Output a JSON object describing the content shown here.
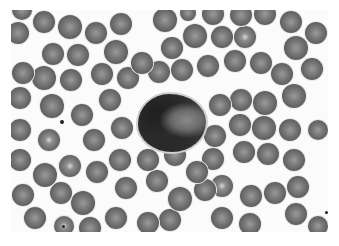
{
  "image": {
    "description": "Grayscale light micrograph of a peripheral blood smear showing a central leukocyte surrounded by erythrocytes",
    "frame": {
      "x": 11,
      "y": 10,
      "width": 317,
      "height": 222
    },
    "background": "#fbfbfb",
    "leukocyte": {
      "x": 138,
      "y": 94,
      "width": 68,
      "height": 58
    },
    "erythrocytes": [
      {
        "x": 22,
        "y": 10,
        "r": 10
      },
      {
        "x": 44,
        "y": 22,
        "r": 11
      },
      {
        "x": 70,
        "y": 27,
        "r": 12
      },
      {
        "x": 96,
        "y": 33,
        "r": 11
      },
      {
        "x": 121,
        "y": 24,
        "r": 11
      },
      {
        "x": 18,
        "y": 33,
        "r": 11
      },
      {
        "x": 165,
        "y": 20,
        "r": 12
      },
      {
        "x": 188,
        "y": 13,
        "r": 8
      },
      {
        "x": 213,
        "y": 14,
        "r": 11
      },
      {
        "x": 241,
        "y": 15,
        "r": 11
      },
      {
        "x": 265,
        "y": 14,
        "r": 11
      },
      {
        "x": 291,
        "y": 22,
        "r": 11
      },
      {
        "x": 316,
        "y": 33,
        "r": 11
      },
      {
        "x": 53,
        "y": 54,
        "r": 11
      },
      {
        "x": 78,
        "y": 55,
        "r": 11
      },
      {
        "x": 116,
        "y": 52,
        "r": 12
      },
      {
        "x": 142,
        "y": 63,
        "r": 11
      },
      {
        "x": 172,
        "y": 48,
        "r": 11
      },
      {
        "x": 195,
        "y": 36,
        "r": 12
      },
      {
        "x": 222,
        "y": 37,
        "r": 11
      },
      {
        "x": 245,
        "y": 37,
        "r": 11,
        "pale": true
      },
      {
        "x": 296,
        "y": 48,
        "r": 12
      },
      {
        "x": 23,
        "y": 73,
        "r": 11
      },
      {
        "x": 44,
        "y": 78,
        "r": 12
      },
      {
        "x": 71,
        "y": 80,
        "r": 11
      },
      {
        "x": 102,
        "y": 74,
        "r": 11
      },
      {
        "x": 128,
        "y": 78,
        "r": 11
      },
      {
        "x": 159,
        "y": 72,
        "r": 11
      },
      {
        "x": 182,
        "y": 70,
        "r": 11
      },
      {
        "x": 208,
        "y": 66,
        "r": 11
      },
      {
        "x": 235,
        "y": 61,
        "r": 11
      },
      {
        "x": 261,
        "y": 63,
        "r": 11
      },
      {
        "x": 282,
        "y": 74,
        "r": 11
      },
      {
        "x": 312,
        "y": 69,
        "r": 11
      },
      {
        "x": 20,
        "y": 98,
        "r": 11
      },
      {
        "x": 52,
        "y": 106,
        "r": 12
      },
      {
        "x": 82,
        "y": 115,
        "r": 11
      },
      {
        "x": 110,
        "y": 100,
        "r": 11
      },
      {
        "x": 220,
        "y": 105,
        "r": 11
      },
      {
        "x": 241,
        "y": 100,
        "r": 11
      },
      {
        "x": 265,
        "y": 103,
        "r": 12
      },
      {
        "x": 294,
        "y": 96,
        "r": 12
      },
      {
        "x": 20,
        "y": 130,
        "r": 11
      },
      {
        "x": 49,
        "y": 140,
        "r": 11,
        "pale": true
      },
      {
        "x": 94,
        "y": 140,
        "r": 11
      },
      {
        "x": 122,
        "y": 128,
        "r": 11
      },
      {
        "x": 215,
        "y": 136,
        "r": 11
      },
      {
        "x": 240,
        "y": 125,
        "r": 11
      },
      {
        "x": 264,
        "y": 128,
        "r": 12
      },
      {
        "x": 290,
        "y": 130,
        "r": 11
      },
      {
        "x": 318,
        "y": 130,
        "r": 10
      },
      {
        "x": 20,
        "y": 160,
        "r": 11
      },
      {
        "x": 45,
        "y": 175,
        "r": 12
      },
      {
        "x": 70,
        "y": 166,
        "r": 11,
        "pale": true
      },
      {
        "x": 97,
        "y": 172,
        "r": 11
      },
      {
        "x": 120,
        "y": 160,
        "r": 11
      },
      {
        "x": 148,
        "y": 160,
        "r": 11
      },
      {
        "x": 175,
        "y": 155,
        "r": 11
      },
      {
        "x": 197,
        "y": 172,
        "r": 11
      },
      {
        "x": 213,
        "y": 159,
        "r": 11
      },
      {
        "x": 244,
        "y": 152,
        "r": 11
      },
      {
        "x": 268,
        "y": 154,
        "r": 11
      },
      {
        "x": 294,
        "y": 160,
        "r": 11
      },
      {
        "x": 23,
        "y": 195,
        "r": 11
      },
      {
        "x": 61,
        "y": 193,
        "r": 11
      },
      {
        "x": 83,
        "y": 203,
        "r": 12
      },
      {
        "x": 126,
        "y": 188,
        "r": 11
      },
      {
        "x": 157,
        "y": 181,
        "r": 11
      },
      {
        "x": 180,
        "y": 199,
        "r": 12
      },
      {
        "x": 205,
        "y": 190,
        "r": 11
      },
      {
        "x": 222,
        "y": 186,
        "r": 11,
        "pale": true
      },
      {
        "x": 251,
        "y": 196,
        "r": 11
      },
      {
        "x": 275,
        "y": 193,
        "r": 11
      },
      {
        "x": 298,
        "y": 187,
        "r": 11
      },
      {
        "x": 35,
        "y": 218,
        "r": 11
      },
      {
        "x": 64,
        "y": 226,
        "r": 10,
        "pale": true
      },
      {
        "x": 90,
        "y": 228,
        "r": 11
      },
      {
        "x": 116,
        "y": 218,
        "r": 11
      },
      {
        "x": 148,
        "y": 223,
        "r": 11
      },
      {
        "x": 170,
        "y": 220,
        "r": 11
      },
      {
        "x": 222,
        "y": 218,
        "r": 11
      },
      {
        "x": 250,
        "y": 224,
        "r": 11
      },
      {
        "x": 296,
        "y": 214,
        "r": 11
      },
      {
        "x": 318,
        "y": 226,
        "r": 10
      }
    ],
    "debris": [
      {
        "x": 62,
        "y": 122,
        "r": 2
      },
      {
        "x": 63,
        "y": 226,
        "r": 1.5
      },
      {
        "x": 326,
        "y": 212,
        "r": 1.5
      }
    ]
  }
}
